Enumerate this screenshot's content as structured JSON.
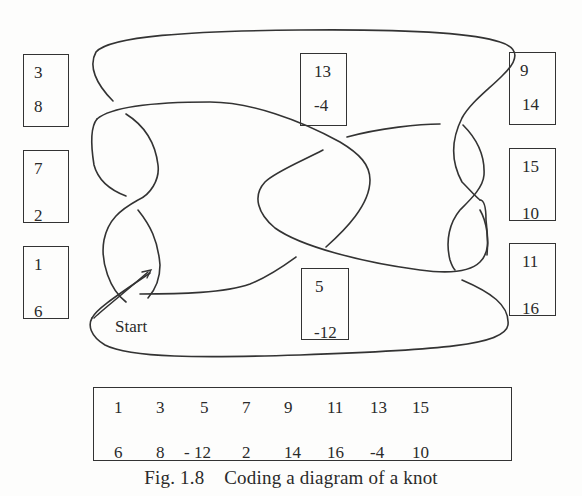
{
  "diagram": {
    "type": "knot-diagram",
    "start_label": "Start",
    "crossing_boxes": [
      {
        "id": "box-3-8",
        "top": "3",
        "bottom": "8",
        "left": 23,
        "y": 54,
        "w": 46,
        "h": 73,
        "tx": 10,
        "bx": 10
      },
      {
        "id": "box-7-2",
        "top": "7",
        "bottom": "2",
        "left": 23,
        "y": 150,
        "w": 46,
        "h": 73,
        "tx": 10,
        "bx": 10
      },
      {
        "id": "box-1-6",
        "top": "1",
        "bottom": "6",
        "left": 23,
        "y": 246,
        "w": 46,
        "h": 73,
        "tx": 10,
        "bx": 10
      },
      {
        "id": "box-13-4",
        "top": "13",
        "bottom": "-4",
        "left": 300,
        "y": 53,
        "w": 47,
        "h": 73,
        "tx": 13,
        "bx": 13
      },
      {
        "id": "box-5-12",
        "top": "5",
        "bottom": "-12",
        "left": 301,
        "y": 268,
        "w": 48,
        "h": 72,
        "tx": 13,
        "bx": 12
      },
      {
        "id": "box-9-14",
        "top": "9",
        "bottom": "14",
        "left": 509,
        "y": 52,
        "w": 47,
        "h": 73,
        "tx": 10,
        "bx": 12
      },
      {
        "id": "box-15-10",
        "top": "15",
        "bottom": "10",
        "left": 509,
        "y": 148,
        "w": 47,
        "h": 73,
        "tx": 12,
        "bx": 12
      },
      {
        "id": "box-11-16",
        "top": "11",
        "bottom": "16",
        "left": 509,
        "y": 243,
        "w": 47,
        "h": 73,
        "tx": 12,
        "bx": 12
      }
    ]
  },
  "code_table": {
    "top_row": [
      "1",
      "3",
      "5",
      "7",
      "9",
      "11",
      "13",
      "15"
    ],
    "bottom_row": [
      "6",
      "8",
      "- 12",
      "2",
      "14",
      "16",
      "-4",
      "10"
    ]
  },
  "caption": {
    "label": "Fig. 1.8",
    "text": "Coding a diagram of a knot",
    "full": "Fig. 1.8    Coding a diagram of a knot"
  },
  "colors": {
    "stroke": "#333333",
    "background": "#fdfdfc",
    "text": "#2a2a2a"
  }
}
